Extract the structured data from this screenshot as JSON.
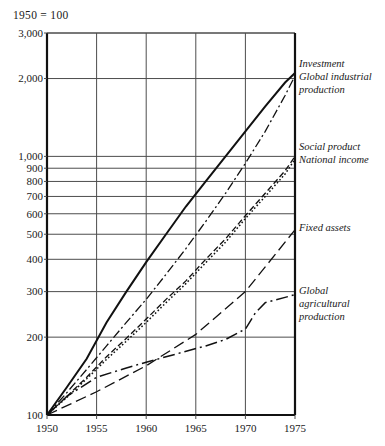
{
  "caption": "1950 = 100",
  "chart_data": {
    "type": "line",
    "title": "1950 = 100",
    "xlabel": "",
    "ylabel": "",
    "yscale": "log",
    "xlim": [
      1950,
      1975
    ],
    "ylim": [
      100,
      3000
    ],
    "grid": true,
    "legend_position": "right-inline",
    "x_ticks": [
      "1950",
      "1955",
      "1960",
      "1965",
      "1970",
      "1975"
    ],
    "x_tick_values": [
      1950,
      1955,
      1960,
      1965,
      1970,
      1975
    ],
    "y_ticks": [
      "100",
      "200",
      "300",
      "400",
      "500",
      "600",
      "700",
      "800",
      "900",
      "1,000",
      "2,000",
      "3,000"
    ],
    "y_tick_values": [
      100,
      200,
      300,
      400,
      500,
      600,
      700,
      800,
      900,
      1000,
      2000,
      3000
    ],
    "series": [
      {
        "name": "Investment",
        "label": "Investment",
        "style": "solid",
        "x": [
          1950,
          1952,
          1954,
          1956,
          1958,
          1960,
          1962,
          1964,
          1966,
          1968,
          1970,
          1972,
          1974,
          1975
        ],
        "values": [
          100,
          128,
          165,
          228,
          300,
          390,
          500,
          640,
          800,
          1000,
          1250,
          1560,
          1930,
          2100
        ]
      },
      {
        "name": "Global industrial production",
        "label": "Global industrial production",
        "style": "dash-dot",
        "x": [
          1950,
          1952,
          1954,
          1956,
          1958,
          1960,
          1962,
          1964,
          1966,
          1968,
          1970,
          1972,
          1974,
          1975
        ],
        "values": [
          100,
          122,
          150,
          185,
          228,
          280,
          350,
          440,
          560,
          720,
          940,
          1250,
          1720,
          2050
        ]
      },
      {
        "name": "Social product",
        "label": "Social product",
        "style": "dashed",
        "x": [
          1950,
          1952,
          1954,
          1956,
          1958,
          1960,
          1962,
          1964,
          1966,
          1968,
          1970,
          1972,
          1974,
          1975
        ],
        "values": [
          100,
          118,
          140,
          168,
          198,
          235,
          280,
          330,
          400,
          480,
          590,
          720,
          880,
          1000
        ]
      },
      {
        "name": "National income",
        "label": "National income",
        "style": "dotted",
        "x": [
          1950,
          1952,
          1954,
          1956,
          1958,
          1960,
          1962,
          1964,
          1966,
          1968,
          1970,
          1972,
          1974,
          1975
        ],
        "values": [
          100,
          117,
          138,
          164,
          193,
          228,
          272,
          322,
          388,
          466,
          575,
          700,
          855,
          975
        ]
      },
      {
        "name": "Fixed assets",
        "label": "Fixed assets",
        "style": "long-dash",
        "x": [
          1950,
          1955,
          1960,
          1965,
          1970,
          1975
        ],
        "values": [
          100,
          123,
          155,
          205,
          300,
          520
        ]
      },
      {
        "name": "Global agricultural production",
        "label": "Global agricultural production",
        "style": "dash-dot-long",
        "x": [
          1950,
          1952,
          1955,
          1958,
          1960,
          1963,
          1966,
          1968,
          1970,
          1971,
          1972,
          1974,
          1975
        ],
        "values": [
          100,
          118,
          140,
          152,
          160,
          172,
          185,
          196,
          215,
          248,
          272,
          285,
          292
        ]
      }
    ],
    "annotations": [
      {
        "text": "Investment",
        "value": 2100,
        "year": 1975
      },
      {
        "text": "Global industrial production",
        "value": 2050,
        "year": 1975
      },
      {
        "text": "Social product",
        "value": 1000,
        "year": 1975
      },
      {
        "text": "National income",
        "value": 975,
        "year": 1975
      },
      {
        "text": "Fixed assets",
        "value": 520,
        "year": 1975
      },
      {
        "text": "Global agricultural production",
        "value": 292,
        "year": 1975
      }
    ],
    "series_labels": {
      "investment": "Investment",
      "global_industrial_l1": "Global industrial",
      "global_industrial_l2": "production",
      "social_product": "Social product",
      "national_income": "National income",
      "fixed_assets": "Fixed assets",
      "global_agri_l1": "Global",
      "global_agri_l2": "agricultural",
      "global_agri_l3": "production"
    }
  }
}
